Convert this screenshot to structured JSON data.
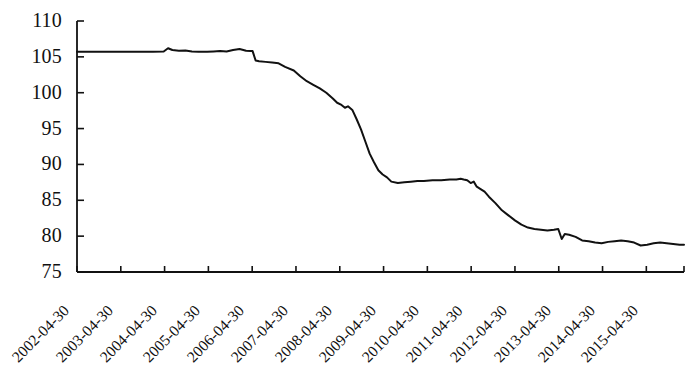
{
  "chart_data": {
    "type": "line",
    "title": "",
    "subtitle": "",
    "xlabel": "",
    "ylabel": "",
    "ylim": [
      75,
      110
    ],
    "y_ticks": [
      75,
      80,
      85,
      90,
      95,
      100,
      105,
      110
    ],
    "grid": false,
    "legend": null,
    "legend_position": "none",
    "line_color": "#111111",
    "line_width": 2,
    "x_tick_labels": [
      "2002-04-30",
      "2003-04-30",
      "2004-04-30",
      "2005-04-30",
      "2006-04-30",
      "2007-04-30",
      "2008-04-30",
      "2009-04-30",
      "2010-04-30",
      "2011-04-30",
      "2012-04-30",
      "2013-04-30",
      "2014-04-30",
      "2015-04-30"
    ],
    "x_label_rotation": -45,
    "x": [
      2002.0,
      2002.25,
      2002.5,
      2002.75,
      2003.0,
      2003.25,
      2003.5,
      2003.75,
      2004.0,
      2004.1,
      2004.2,
      2004.35,
      2004.5,
      2004.65,
      2004.8,
      2005.0,
      2005.15,
      2005.3,
      2005.45,
      2005.6,
      2005.75,
      2005.9,
      2006.0,
      2006.05,
      2006.12,
      2006.2,
      2006.35,
      2006.5,
      2006.65,
      2006.8,
      2007.0,
      2007.15,
      2007.3,
      2007.45,
      2007.6,
      2007.75,
      2007.9,
      2008.0,
      2008.1,
      2008.18,
      2008.25,
      2008.35,
      2008.45,
      2008.55,
      2008.65,
      2008.75,
      2008.85,
      2008.95,
      2009.05,
      2009.15,
      2009.25,
      2009.4,
      2009.55,
      2009.7,
      2009.85,
      2010.0,
      2010.2,
      2010.4,
      2010.6,
      2010.75,
      2010.85,
      2010.92,
      2011.0,
      2011.08,
      2011.15,
      2011.22,
      2011.3,
      2011.4,
      2011.5,
      2011.65,
      2011.8,
      2011.95,
      2012.1,
      2012.25,
      2012.4,
      2012.55,
      2012.7,
      2012.85,
      2013.0,
      2013.1,
      2013.18,
      2013.25,
      2013.35,
      2013.5,
      2013.65,
      2013.8,
      2013.95,
      2014.1,
      2014.25,
      2014.4,
      2014.55,
      2014.7,
      2014.85,
      2015.0,
      2015.15,
      2015.3,
      2015.45,
      2015.6,
      2015.75,
      2015.9,
      2016.0
    ],
    "y": [
      105.7,
      105.7,
      105.7,
      105.7,
      105.7,
      105.7,
      105.7,
      105.7,
      105.75,
      106.2,
      105.95,
      105.85,
      105.9,
      105.75,
      105.7,
      105.7,
      105.75,
      105.8,
      105.75,
      105.95,
      106.1,
      105.85,
      105.8,
      105.8,
      104.5,
      104.4,
      104.3,
      104.2,
      104.1,
      103.6,
      103.1,
      102.3,
      101.6,
      101.1,
      100.6,
      100.0,
      99.2,
      98.6,
      98.3,
      97.9,
      98.1,
      97.6,
      96.3,
      94.9,
      93.2,
      91.5,
      90.3,
      89.2,
      88.6,
      88.2,
      87.6,
      87.4,
      87.5,
      87.6,
      87.7,
      87.7,
      87.8,
      87.8,
      87.9,
      87.9,
      88.0,
      87.9,
      87.8,
      87.4,
      87.6,
      86.9,
      86.6,
      86.2,
      85.5,
      84.6,
      83.6,
      82.9,
      82.2,
      81.6,
      81.2,
      81.0,
      80.9,
      80.8,
      80.9,
      81.0,
      79.6,
      80.3,
      80.2,
      79.9,
      79.4,
      79.3,
      79.1,
      79.0,
      79.2,
      79.3,
      79.4,
      79.3,
      79.1,
      78.7,
      78.8,
      79.0,
      79.1,
      79.0,
      78.9,
      78.8,
      78.8
    ]
  },
  "axes": {
    "y_axis_name": "y-axis",
    "x_axis_name": "x-axis"
  }
}
